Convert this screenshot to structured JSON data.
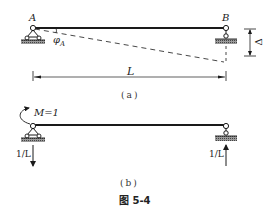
{
  "figure": {
    "title": "图 5-4",
    "panel_a": {
      "caption": "(a)",
      "node_a_label": "A",
      "node_b_label": "B",
      "rotation_label": "φ",
      "rotation_subscript": "A",
      "span_label": "L",
      "settlement_label": "Δ"
    },
    "panel_b": {
      "caption": "(b)",
      "moment_label": "M=1",
      "reaction_left_label": "1/L",
      "reaction_right_label": "1/L"
    },
    "colors": {
      "line": "#1a1a1a",
      "hatch": "#555555",
      "dashed": "#333333"
    }
  }
}
